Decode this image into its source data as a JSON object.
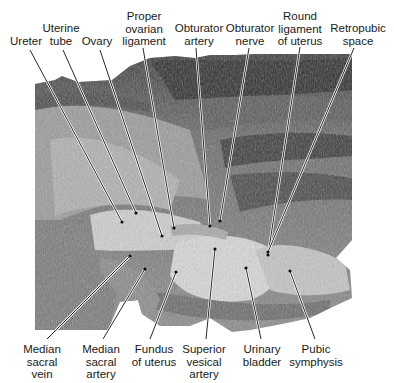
{
  "figure": {
    "colors": {
      "background": "#ffffff",
      "label_text": "#1a1a1a",
      "leader_line": "#111111",
      "leader_highlight": "#ffffff"
    }
  },
  "labels_top": [
    {
      "id": "ureter",
      "lines": [
        "Ureter"
      ],
      "x": 26,
      "y": 35
    },
    {
      "id": "uterine-tube",
      "lines": [
        "Uterine",
        "tube"
      ],
      "x": 61,
      "y": 22
    },
    {
      "id": "ovary",
      "lines": [
        "Ovary"
      ],
      "x": 97,
      "y": 35
    },
    {
      "id": "proper-ovarian-ligament",
      "lines": [
        "Proper",
        "ovarian",
        "ligament"
      ],
      "x": 144,
      "y": 10
    },
    {
      "id": "obturator-artery",
      "lines": [
        "Obturator",
        "artery"
      ],
      "x": 199,
      "y": 22
    },
    {
      "id": "obturator-nerve",
      "lines": [
        "Obturator",
        "nerve"
      ],
      "x": 250,
      "y": 22
    },
    {
      "id": "round-ligament-of-uterus",
      "lines": [
        "Round",
        "ligament",
        "of uterus"
      ],
      "x": 300,
      "y": 10
    },
    {
      "id": "retropubic-space",
      "lines": [
        "Retropubic",
        "space"
      ],
      "x": 358,
      "y": 22
    }
  ],
  "labels_bottom": [
    {
      "id": "median-sacral-vein",
      "lines": [
        "Median",
        "sacral",
        "vein"
      ],
      "x": 42,
      "y": 343
    },
    {
      "id": "median-sacral-artery",
      "lines": [
        "Median",
        "sacral",
        "artery"
      ],
      "x": 101,
      "y": 343
    },
    {
      "id": "fundus-of-uterus",
      "lines": [
        "Fundus",
        "of uterus"
      ],
      "x": 154,
      "y": 343
    },
    {
      "id": "superior-vesical-artery",
      "lines": [
        "Superior",
        "vesical",
        "artery"
      ],
      "x": 204,
      "y": 343
    },
    {
      "id": "urinary-bladder",
      "lines": [
        "Urinary",
        "bladder"
      ],
      "x": 262,
      "y": 343
    },
    {
      "id": "pubic-symphysis",
      "lines": [
        "Pubic",
        "symphysis"
      ],
      "x": 316,
      "y": 343
    }
  ],
  "leaders": [
    {
      "id": "ureter",
      "x1": 30,
      "y1": 50,
      "x2": 122,
      "y2": 222
    },
    {
      "id": "uterine-tube",
      "x1": 63,
      "y1": 50,
      "x2": 136,
      "y2": 213
    },
    {
      "id": "ovary",
      "x1": 100,
      "y1": 50,
      "x2": 162,
      "y2": 236
    },
    {
      "id": "proper-ovarian-ligament",
      "x1": 143,
      "y1": 48,
      "x2": 174,
      "y2": 228
    },
    {
      "id": "obturator-artery",
      "x1": 196,
      "y1": 48,
      "x2": 210,
      "y2": 226
    },
    {
      "id": "obturator-nerve",
      "x1": 249,
      "y1": 48,
      "x2": 220,
      "y2": 221
    },
    {
      "id": "round-ligament-of-uterus",
      "x1": 300,
      "y1": 47,
      "x2": 268,
      "y2": 255
    },
    {
      "id": "retropubic-space",
      "x1": 354,
      "y1": 48,
      "x2": 268,
      "y2": 252
    },
    {
      "id": "median-sacral-vein",
      "x1": 47,
      "y1": 339,
      "x2": 130,
      "y2": 256
    },
    {
      "id": "median-sacral-artery",
      "x1": 103,
      "y1": 339,
      "x2": 145,
      "y2": 269
    },
    {
      "id": "fundus-of-uterus",
      "x1": 150,
      "y1": 339,
      "x2": 176,
      "y2": 272
    },
    {
      "id": "superior-vesical-artery",
      "x1": 206,
      "y1": 339,
      "x2": 215,
      "y2": 249
    },
    {
      "id": "urinary-bladder",
      "x1": 261,
      "y1": 339,
      "x2": 246,
      "y2": 268
    },
    {
      "id": "pubic-symphysis",
      "x1": 315,
      "y1": 339,
      "x2": 290,
      "y2": 271
    }
  ]
}
